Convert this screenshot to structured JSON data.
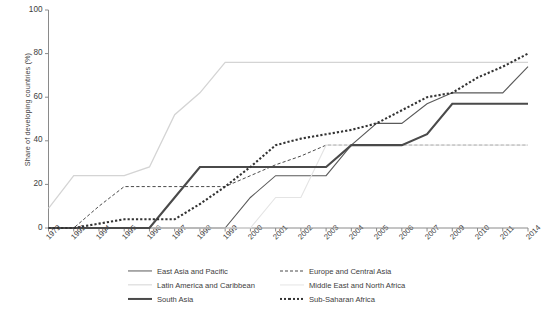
{
  "chart_data": {
    "type": "line",
    "title": "",
    "xlabel": "",
    "ylabel": "Share of developing countries (%)",
    "ylim": [
      0,
      100
    ],
    "yticks": [
      0,
      20,
      40,
      60,
      80,
      100
    ],
    "grid": false,
    "legend_position": "bottom",
    "categories": [
      "1979",
      "1992",
      "1994",
      "1995",
      "1996",
      "1997",
      "1998",
      "1999",
      "2000",
      "2001",
      "2002",
      "2003",
      "2004",
      "2005",
      "2006",
      "2007",
      "2009",
      "2010",
      "2011",
      "2014"
    ],
    "series": [
      {
        "name": "East Asia and Pacific",
        "color": "#5a5a5a",
        "style": "solid",
        "width": 1.1,
        "values": [
          0,
          0,
          0,
          0,
          0,
          0,
          0,
          0,
          14,
          24,
          24,
          24,
          38,
          48,
          48,
          57,
          62,
          62,
          62,
          74
        ]
      },
      {
        "name": "Europe and Central Asia",
        "color": "#4a4a4a",
        "style": "dashed",
        "width": 1.0,
        "values": [
          0,
          0,
          10,
          19,
          19,
          19,
          19,
          19,
          24,
          29,
          33,
          38,
          38,
          38,
          38,
          38,
          38,
          38,
          38,
          38
        ]
      },
      {
        "name": "Latin America and Caribbean",
        "color": "#d4d4d4",
        "style": "solid",
        "width": 1.3,
        "values": [
          9,
          24,
          24,
          24,
          28,
          52,
          62,
          76,
          76,
          76,
          76,
          76,
          76,
          76,
          76,
          76,
          76,
          76,
          76,
          76
        ]
      },
      {
        "name": "Middle East and North Africa",
        "color": "#e4e4e4",
        "style": "solid",
        "width": 1.1,
        "values": [
          0,
          0,
          0,
          0,
          0,
          0,
          0,
          0,
          0,
          14,
          14,
          38,
          38,
          38,
          38,
          38,
          38,
          38,
          38,
          38
        ]
      },
      {
        "name": "South Asia",
        "color": "#4a4a4a",
        "style": "solid",
        "width": 2.1,
        "values": [
          0,
          0,
          0,
          0,
          0,
          14,
          28,
          28,
          28,
          28,
          28,
          28,
          38,
          38,
          38,
          43,
          57,
          57,
          57,
          57
        ]
      },
      {
        "name": "Sub-Saharan Africa",
        "color": "#333333",
        "style": "dotted",
        "width": 2.1,
        "values": [
          0,
          0,
          2,
          4,
          4,
          4,
          11,
          19,
          28,
          38,
          41,
          43,
          45,
          48,
          54,
          60,
          62,
          69,
          74,
          80
        ]
      }
    ]
  },
  "axis": {
    "y_tick_labels": [
      "0",
      "20",
      "40",
      "60",
      "80",
      "100"
    ],
    "x_tick_labels": [
      "1979",
      "1992",
      "1994",
      "1995",
      "1996",
      "1997",
      "1998",
      "1999",
      "2000",
      "2001",
      "2002",
      "2003",
      "2004",
      "2005",
      "2006",
      "2007",
      "2009",
      "2010",
      "2011",
      "2014"
    ],
    "y_axis_title": "Share of developing countries (%)"
  },
  "legend": {
    "items": [
      {
        "label": "East Asia and Pacific",
        "style": "solid",
        "color": "#5a5a5a",
        "width": 1.1
      },
      {
        "label": "Europe and Central Asia",
        "style": "dashed",
        "color": "#4a4a4a",
        "width": 1.0
      },
      {
        "label": "Latin America and Caribbean",
        "style": "solid",
        "color": "#d4d4d4",
        "width": 1.3
      },
      {
        "label": "Middle East and North Africa",
        "style": "solid",
        "color": "#e4e4e4",
        "width": 1.1
      },
      {
        "label": "South Asia",
        "style": "solid",
        "color": "#4a4a4a",
        "width": 2.1
      },
      {
        "label": "Sub-Saharan Africa",
        "style": "dotted",
        "color": "#333333",
        "width": 2.1
      }
    ]
  },
  "colors": {
    "axis": "#8a8a8a",
    "text": "#3d3d3d",
    "background": "#ffffff"
  }
}
